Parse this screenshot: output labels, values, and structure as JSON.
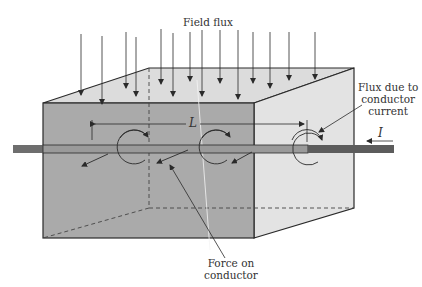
{
  "labels": {
    "field_flux": "Field flux",
    "flux_conductor_line1": "Flux due to",
    "flux_conductor_line2": "conductor",
    "flux_conductor_line3": "current",
    "length": "L",
    "current": "I",
    "force_line1": "Force on",
    "force_line2": "conductor"
  },
  "colors": {
    "front_face": "#a9a9a9",
    "top_face": "#dcdcdc",
    "side_face": "#e2e2e2",
    "conductor": "#6e6e6e",
    "line": "#2a2a2a"
  }
}
